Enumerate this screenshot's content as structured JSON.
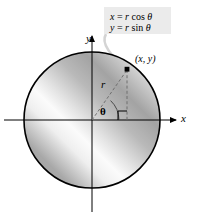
{
  "figure": {
    "type": "polar-coordinates-diagram",
    "background_color": "#ffffff",
    "width": 197,
    "height": 216
  },
  "axes": {
    "x_label": "x",
    "y_label": "y",
    "origin": {
      "x": 92,
      "y": 120
    },
    "color": "#000000"
  },
  "circle": {
    "center": {
      "x": 92,
      "y": 120
    },
    "radius": 68,
    "stroke_color": "#000000",
    "fill_description": "diagonal gray gradient",
    "gradient_colors": [
      "#9a9a9a",
      "#f2f2f2",
      "#b5b5b5",
      "#8f8f8f"
    ]
  },
  "point": {
    "label": "(x, y)",
    "position": {
      "x": 128,
      "y": 70
    },
    "marker_color": "#000000"
  },
  "radius_line": {
    "label": "r",
    "style": "dashed",
    "color": "#7a7a7a"
  },
  "drop_line": {
    "style": "dashed",
    "color": "#7a7a7a"
  },
  "angle": {
    "label": "θ",
    "arc_color": "#555555",
    "right_angle_marker": true
  },
  "callout": {
    "background_color": "#ebebeb",
    "leader_color": "#d0d0d0",
    "equations": [
      {
        "lhs": "x",
        "eq": " = ",
        "rhs_var": "r",
        "func": "cos",
        "angle": "θ"
      },
      {
        "lhs": "y",
        "eq": " = ",
        "rhs_var": "r",
        "func": "sin",
        "angle": "θ"
      }
    ],
    "line1_full": "x = r cos θ",
    "line2_full": "y = r sin θ"
  }
}
